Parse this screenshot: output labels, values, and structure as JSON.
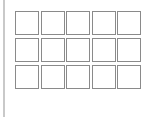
{
  "panel": {
    "left_bar_color": "#c9c9c9",
    "cell_border_color": "#8a8a8a",
    "rows": 3,
    "columns": 5
  },
  "grid": {
    "cells": [
      {
        "row": 1,
        "col": 1,
        "filled": false
      },
      {
        "row": 1,
        "col": 2,
        "filled": false
      },
      {
        "row": 1,
        "col": 3,
        "filled": false
      },
      {
        "row": 1,
        "col": 4,
        "filled": false
      },
      {
        "row": 1,
        "col": 5,
        "filled": false
      },
      {
        "row": 2,
        "col": 1,
        "filled": false
      },
      {
        "row": 2,
        "col": 2,
        "filled": false
      },
      {
        "row": 2,
        "col": 3,
        "filled": false
      },
      {
        "row": 2,
        "col": 4,
        "filled": false
      },
      {
        "row": 2,
        "col": 5,
        "filled": false
      },
      {
        "row": 3,
        "col": 1,
        "filled": false
      },
      {
        "row": 3,
        "col": 2,
        "filled": false
      },
      {
        "row": 3,
        "col": 3,
        "filled": false
      },
      {
        "row": 3,
        "col": 4,
        "filled": false
      },
      {
        "row": 3,
        "col": 5,
        "filled": false
      }
    ]
  }
}
